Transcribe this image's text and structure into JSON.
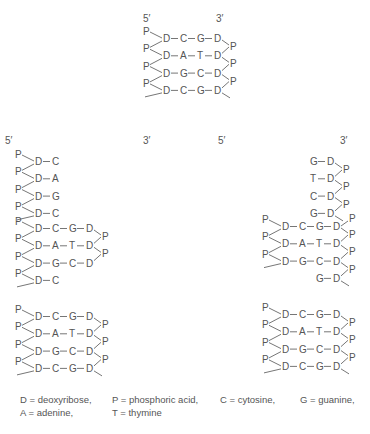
{
  "diagram": {
    "top_duplex": {
      "end_left": "5′",
      "end_right": "3′",
      "rows": [
        [
          "D",
          "C",
          "G",
          "D"
        ],
        [
          "D",
          "A",
          "T",
          "D"
        ],
        [
          "D",
          "G",
          "C",
          "D"
        ],
        [
          "D",
          "C",
          "G",
          "D"
        ]
      ]
    },
    "separation_labels": {
      "left_strand_start": "5′",
      "left_strand_end": "3′",
      "right_strand_start": "5′",
      "right_strand_end": "3′"
    },
    "left_strand": {
      "rows": [
        [
          "D",
          "C"
        ],
        [
          "D",
          "A"
        ],
        [
          "D",
          "G"
        ],
        [
          "D",
          "C"
        ]
      ]
    },
    "right_strand": {
      "rows": [
        [
          "G",
          "D"
        ],
        [
          "T",
          "D"
        ],
        [
          "C",
          "D"
        ],
        [
          "G",
          "D"
        ]
      ]
    },
    "left_replicating": {
      "rows": [
        [
          "D",
          "C",
          "G",
          "D"
        ],
        [
          "D",
          "A",
          "T",
          "D"
        ],
        [
          "D",
          "G",
          "C",
          "D"
        ],
        [
          "D",
          "C"
        ]
      ]
    },
    "right_replicating": {
      "rows": [
        [
          "D",
          "C",
          "G",
          "D"
        ],
        [
          "D",
          "A",
          "T",
          "D"
        ],
        [
          "D",
          "G",
          "C",
          "D"
        ],
        [
          "G",
          "D"
        ]
      ]
    },
    "left_daughter": {
      "rows": [
        [
          "D",
          "C",
          "G",
          "D"
        ],
        [
          "D",
          "A",
          "T",
          "D"
        ],
        [
          "D",
          "G",
          "C",
          "D"
        ],
        [
          "D",
          "C",
          "G",
          "D"
        ]
      ]
    },
    "right_daughter": {
      "rows": [
        [
          "D",
          "C",
          "G",
          "D"
        ],
        [
          "D",
          "A",
          "T",
          "D"
        ],
        [
          "D",
          "G",
          "C",
          "D"
        ],
        [
          "D",
          "C",
          "G",
          "D"
        ]
      ]
    },
    "phosphate_label": "P"
  },
  "legend": {
    "items": [
      "D = deoxyribose,",
      "P = phosphoric acid,",
      "C = cytosine,",
      "G = guanine,",
      "A = adenine,",
      "T = thymine"
    ]
  }
}
